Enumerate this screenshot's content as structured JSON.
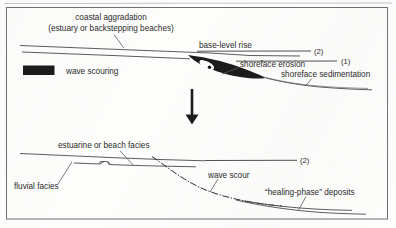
{
  "figure": {
    "caption_visible": false,
    "panels": [
      {
        "id": "upper",
        "labels": {
          "coastal_aggradation_line1": "coastal aggradation",
          "coastal_aggradation_line2": "(estuary or backstepping beaches)",
          "base_level_rise": "base-level rise",
          "shoreface_erosion": "shoreface erosion",
          "shoreface_sedimentation": "shoreface sedimentation",
          "marker_2": "(2)",
          "marker_1": "(1)"
        },
        "legend": {
          "swatch_label": "wave scouring",
          "swatch_color": "#1c1c1c"
        }
      },
      {
        "id": "lower",
        "labels": {
          "estuarine_or_beach_facies": "estuarine or beach facies",
          "fluvial_facies": "fluvial facies",
          "wave_scour": "wave scour",
          "healing_phase_deposits": "“healing-phase” deposits",
          "marker_2": "(2)"
        }
      }
    ],
    "arrow": {
      "name": "down-arrow",
      "direction": "down"
    },
    "colors": {
      "ink": "#2b2b2b",
      "line": "#4a4a4a",
      "fill_dark": "#1c1c1c",
      "frame": "#6f6f6f",
      "paper": "#fdfdfc"
    }
  }
}
